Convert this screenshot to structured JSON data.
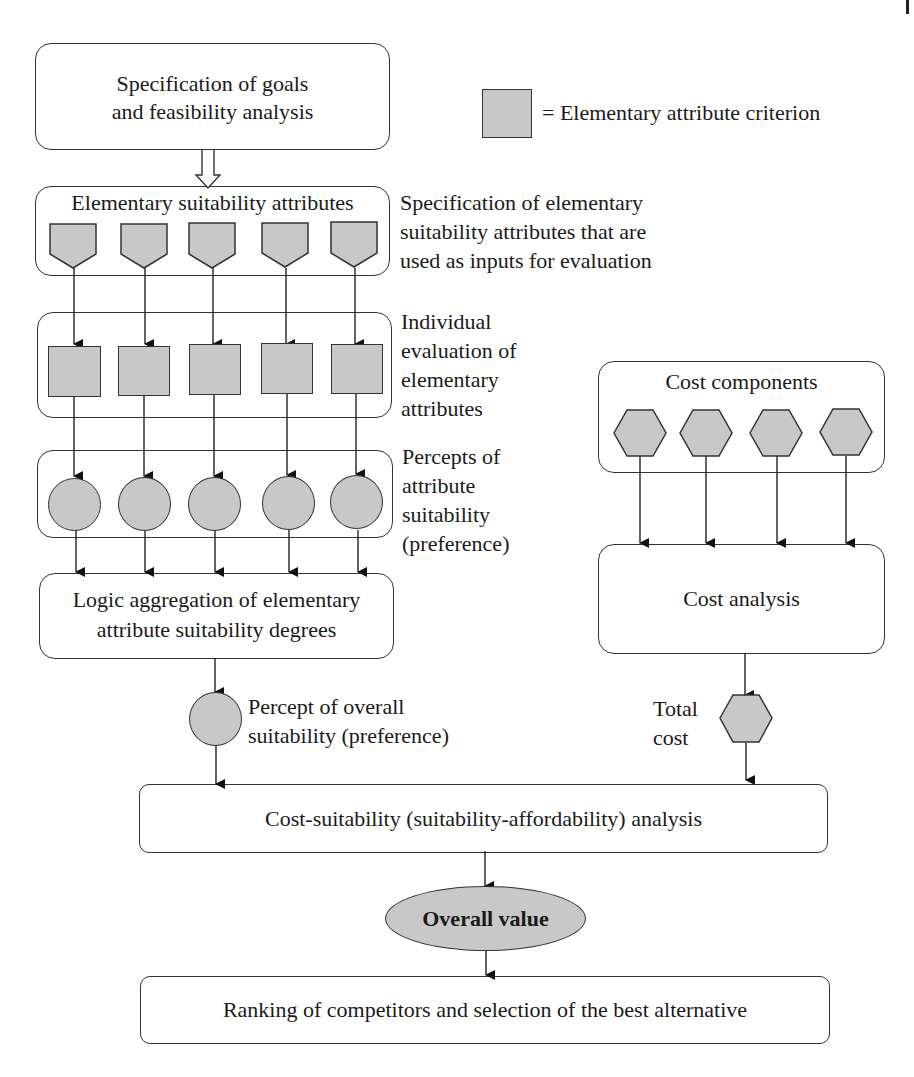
{
  "legend": {
    "symbol": "gray-square",
    "text": "= Elementary attribute criterion"
  },
  "nodes": {
    "goals": {
      "line1": "Specification of goals",
      "line2": "and feasibility analysis"
    },
    "attributes": {
      "title": "Elementary suitability attributes",
      "count": 5
    },
    "evaluation": {
      "count": 5
    },
    "percepts": {
      "count": 5
    },
    "aggregation": {
      "line1": "Logic aggregation of elementary",
      "line2": "attribute suitability degrees"
    },
    "cost_components": {
      "title": "Cost components",
      "count": 4
    },
    "cost_analysis": {
      "title": "Cost analysis"
    },
    "cost_suitability": {
      "title": "Cost-suitability (suitability-affordability) analysis"
    },
    "overall_value": {
      "title": "Overall value"
    },
    "ranking": {
      "title": "Ranking of competitors and selection of the best alternative"
    }
  },
  "annotations": {
    "attributes_spec": [
      "Specification of elementary",
      "suitability attributes that are",
      "used as inputs for evaluation"
    ],
    "individual_eval": [
      "Individual",
      "evaluation of",
      "elementary",
      "attributes"
    ],
    "percepts_attr": [
      "Percepts of",
      "attribute",
      "suitability",
      "(preference)"
    ],
    "percept_overall": [
      "Percept of overall",
      "suitability (preference)"
    ],
    "total_cost": [
      "Total",
      "cost"
    ]
  },
  "colors": {
    "shape_fill": "#c8c8c8",
    "stroke": "#333333",
    "background": "#ffffff"
  }
}
